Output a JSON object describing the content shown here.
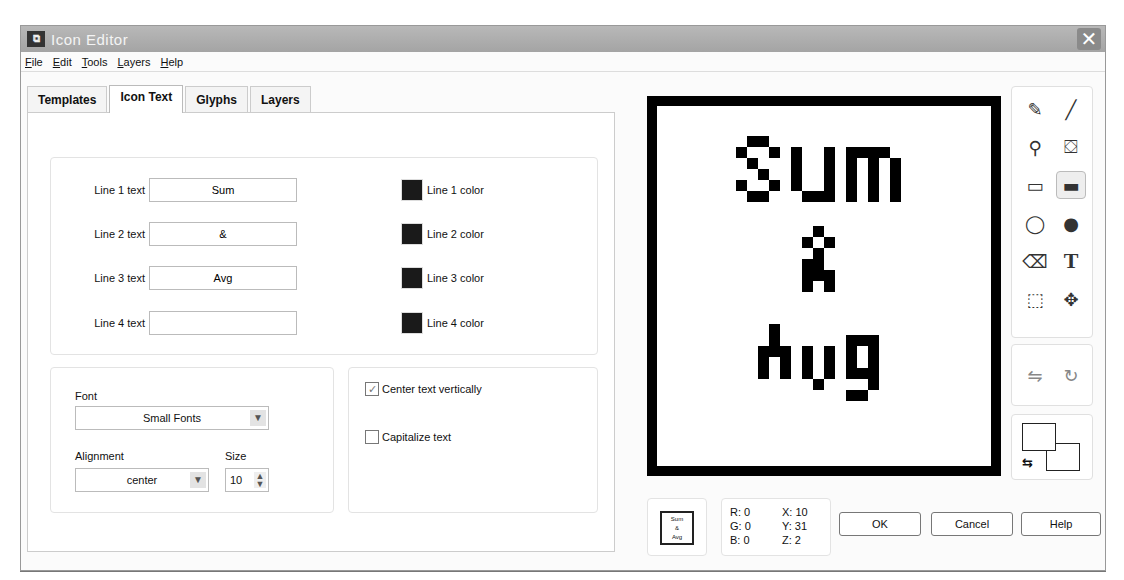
{
  "window": {
    "title": "Icon Editor",
    "close_glyph": "✕",
    "app_icon_glyph": "⧉"
  },
  "menu": [
    {
      "label": "File",
      "mnemonic": "F",
      "rest": "ile"
    },
    {
      "label": "Edit",
      "mnemonic": "E",
      "rest": "dit"
    },
    {
      "label": "Tools",
      "mnemonic": "T",
      "rest": "ools"
    },
    {
      "label": "Layers",
      "mnemonic": "L",
      "rest": "ayers"
    },
    {
      "label": "Help",
      "mnemonic": "H",
      "rest": "elp"
    }
  ],
  "tabs": [
    {
      "label": "Templates",
      "active": false
    },
    {
      "label": "Icon Text",
      "active": true
    },
    {
      "label": "Glyphs",
      "active": false
    },
    {
      "label": "Layers",
      "active": false
    }
  ],
  "icon_text": {
    "lines": [
      {
        "label": "Line 1 text",
        "value": "Sum",
        "color_label": "Line 1 color",
        "color": "#1a1a1a"
      },
      {
        "label": "Line 2 text",
        "value": "&",
        "color_label": "Line 2 color",
        "color": "#1a1a1a"
      },
      {
        "label": "Line 3 text",
        "value": "Avg",
        "color_label": "Line 3 color",
        "color": "#1a1a1a"
      },
      {
        "label": "Line 4 text",
        "value": "",
        "color_label": "Line 4 color",
        "color": "#1a1a1a"
      }
    ],
    "font_label": "Font",
    "font_value": "Small Fonts",
    "alignment_label": "Alignment",
    "alignment_value": "center",
    "size_label": "Size",
    "size_value": "10",
    "center_vertically_label": "Center text vertically",
    "center_vertically_checked": true,
    "capitalize_label": "Capitalize text",
    "capitalize_checked": false
  },
  "canvas": {
    "lines": [
      "Sum",
      "&",
      "Avg"
    ]
  },
  "tools": [
    {
      "name": "pencil",
      "glyph": "✎"
    },
    {
      "name": "line",
      "glyph": "╱"
    },
    {
      "name": "color-picker",
      "glyph": "⚲"
    },
    {
      "name": "fill",
      "glyph": "⛋"
    },
    {
      "name": "rectangle",
      "glyph": "▭"
    },
    {
      "name": "filled-rectangle",
      "glyph": "▬"
    },
    {
      "name": "ellipse",
      "glyph": "◯"
    },
    {
      "name": "filled-ellipse",
      "glyph": "●"
    },
    {
      "name": "eraser",
      "glyph": "⌫"
    },
    {
      "name": "text",
      "glyph": "T"
    },
    {
      "name": "select",
      "glyph": "⬚"
    },
    {
      "name": "move",
      "glyph": "✥"
    }
  ],
  "transform_tools": [
    {
      "name": "flip-horizontal",
      "glyph": "⇋"
    },
    {
      "name": "rotate",
      "glyph": "↻"
    }
  ],
  "swap_glyph": "⇆",
  "preview": {
    "lines": [
      "Sum",
      "&",
      "Avg"
    ]
  },
  "info": {
    "r": "R: 0",
    "g": "G: 0",
    "b": "B: 0",
    "x": "X: 10",
    "y": "Y: 31",
    "z": "Z: 2"
  },
  "buttons": {
    "ok": "OK",
    "cancel": "Cancel",
    "help": "Help"
  }
}
